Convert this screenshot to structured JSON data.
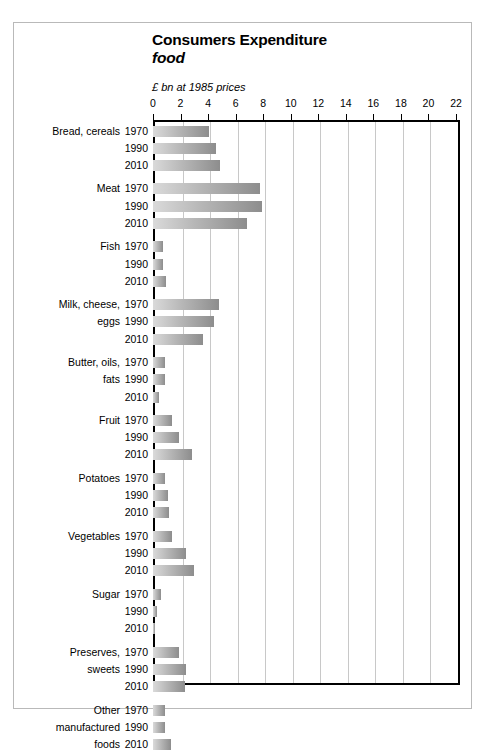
{
  "chart": {
    "title": "Consumers Expenditure",
    "subtitle": "food",
    "units": "£ bn at 1985 prices"
  },
  "chart_data": {
    "type": "bar",
    "orientation": "horizontal",
    "title": "Consumers Expenditure",
    "subtitle": "food",
    "xlabel": "£ bn at 1985 prices",
    "ylabel": "",
    "xlim": [
      0,
      22
    ],
    "xticks": [
      0,
      2,
      4,
      6,
      8,
      10,
      12,
      14,
      16,
      18,
      20,
      22
    ],
    "grid": true,
    "legend": null,
    "series": [
      {
        "name": "1970",
        "values": [
          4.1,
          7.8,
          0.7,
          4.8,
          0.9,
          1.4,
          0.85,
          1.4,
          0.55,
          1.9,
          0.85
        ]
      },
      {
        "name": "1990",
        "values": [
          4.6,
          7.9,
          0.75,
          4.4,
          0.85,
          1.9,
          1.1,
          2.4,
          0.3,
          2.4,
          0.85
        ]
      },
      {
        "name": "2010",
        "values": [
          4.9,
          6.8,
          0.95,
          3.6,
          0.45,
          2.8,
          1.15,
          3.0,
          0.12,
          2.3,
          1.3
        ]
      }
    ],
    "categories": [
      "Bread, cereals",
      "Meat",
      "Fish",
      "Milk, cheese, eggs",
      "Butter, oils, fats",
      "Fruit",
      "Potatoes",
      "Vegetables",
      "Sugar",
      "Preserves, sweets",
      "Other manufactured foods"
    ],
    "groups": [
      {
        "label_lines": [
          "Bread, cereals",
          "",
          ""
        ],
        "bars": [
          {
            "year": "1970",
            "value": 4.1
          },
          {
            "year": "1990",
            "value": 4.6
          },
          {
            "year": "2010",
            "value": 4.9
          }
        ]
      },
      {
        "label_lines": [
          "Meat",
          "",
          ""
        ],
        "bars": [
          {
            "year": "1970",
            "value": 7.8
          },
          {
            "year": "1990",
            "value": 7.9
          },
          {
            "year": "2010",
            "value": 6.8
          }
        ]
      },
      {
        "label_lines": [
          "Fish",
          "",
          ""
        ],
        "bars": [
          {
            "year": "1970",
            "value": 0.7
          },
          {
            "year": "1990",
            "value": 0.75
          },
          {
            "year": "2010",
            "value": 0.95
          }
        ]
      },
      {
        "label_lines": [
          "Milk, cheese,",
          "eggs",
          ""
        ],
        "bars": [
          {
            "year": "1970",
            "value": 4.8
          },
          {
            "year": "1990",
            "value": 4.4
          },
          {
            "year": "2010",
            "value": 3.6
          }
        ]
      },
      {
        "label_lines": [
          "Butter, oils,",
          "fats",
          ""
        ],
        "bars": [
          {
            "year": "1970",
            "value": 0.9
          },
          {
            "year": "1990",
            "value": 0.85
          },
          {
            "year": "2010",
            "value": 0.45
          }
        ]
      },
      {
        "label_lines": [
          "Fruit",
          "",
          ""
        ],
        "bars": [
          {
            "year": "1970",
            "value": 1.4
          },
          {
            "year": "1990",
            "value": 1.9
          },
          {
            "year": "2010",
            "value": 2.8
          }
        ]
      },
      {
        "label_lines": [
          "Potatoes",
          "",
          ""
        ],
        "bars": [
          {
            "year": "1970",
            "value": 0.85
          },
          {
            "year": "1990",
            "value": 1.1
          },
          {
            "year": "2010",
            "value": 1.15
          }
        ]
      },
      {
        "label_lines": [
          "Vegetables",
          "",
          ""
        ],
        "bars": [
          {
            "year": "1970",
            "value": 1.4
          },
          {
            "year": "1990",
            "value": 2.4
          },
          {
            "year": "2010",
            "value": 3.0
          }
        ]
      },
      {
        "label_lines": [
          "Sugar",
          "",
          ""
        ],
        "bars": [
          {
            "year": "1970",
            "value": 0.55
          },
          {
            "year": "1990",
            "value": 0.3
          },
          {
            "year": "2010",
            "value": 0.12
          }
        ]
      },
      {
        "label_lines": [
          "Preserves,",
          "sweets",
          ""
        ],
        "bars": [
          {
            "year": "1970",
            "value": 1.9
          },
          {
            "year": "1990",
            "value": 2.4
          },
          {
            "year": "2010",
            "value": 2.3
          }
        ]
      },
      {
        "label_lines": [
          "Other",
          "manufactured",
          "foods"
        ],
        "bars": [
          {
            "year": "1970",
            "value": 0.85
          },
          {
            "year": "1990",
            "value": 0.85
          },
          {
            "year": "2010",
            "value": 1.3
          }
        ]
      }
    ]
  },
  "style": {
    "bar_fill_light": "#dadada",
    "bar_fill_dark": "#8d8d8d",
    "axis_color": "#000000",
    "grid_color": "#c8c8c8",
    "frame_color": "#b9b9b9",
    "background": "#ffffff"
  }
}
